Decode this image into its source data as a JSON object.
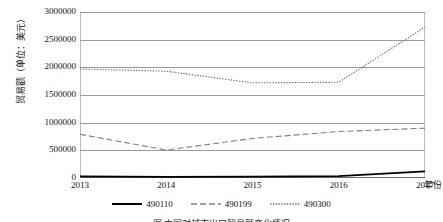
{
  "chart_data": {
    "type": "line",
    "title": "",
    "xlabel": "年份",
    "ylabel": "贸易额（单位：美元）",
    "categories": [
      "2013",
      "2014",
      "2015",
      "2016",
      "2017"
    ],
    "x": [
      2013,
      2014,
      2015,
      2016,
      2017
    ],
    "ylim": [
      0,
      3000000
    ],
    "xlim": [
      2013,
      2017
    ],
    "yticks": [
      0,
      500000,
      1000000,
      1500000,
      2000000,
      2500000,
      3000000
    ],
    "ytick_labels": [
      "0",
      "500000",
      "1000000",
      "1500000",
      "2000000",
      "2500000",
      "3000000"
    ],
    "grid": "horizontal",
    "legend_position": "bottom",
    "series": [
      {
        "name": "490110",
        "style": "solid",
        "color": "#000000",
        "values": [
          28000,
          22000,
          26000,
          35000,
          120000
        ]
      },
      {
        "name": "490199",
        "style": "dashed",
        "color": "#808080",
        "values": [
          790000,
          505000,
          715000,
          840000,
          900000
        ]
      },
      {
        "name": "490300",
        "style": "dotted",
        "color": "#6e6e6e",
        "values": [
          1970000,
          1930000,
          1720000,
          1730000,
          2730000
        ]
      }
    ]
  },
  "axes": {
    "y_title": "贸易额（单位：美元）",
    "x_title": "年份"
  },
  "legend": {
    "items": [
      {
        "label": "490110",
        "style": "solid"
      },
      {
        "label": "490199",
        "style": "dashed"
      },
      {
        "label": "490300",
        "style": "dotted"
      }
    ]
  },
  "caption": {
    "text": "图 中国对越南出口贸易额变化情况"
  }
}
